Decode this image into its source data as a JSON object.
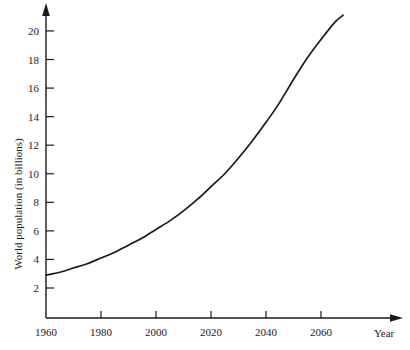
{
  "chart_data": {
    "type": "line",
    "title": "",
    "xlabel": "Year",
    "ylabel": "World population (in billions)",
    "xlim": [
      1955,
      2072
    ],
    "ylim": [
      0,
      21.6
    ],
    "grid": false,
    "legend": "none",
    "x_ticks": [
      1960,
      1980,
      2000,
      2020,
      2040,
      2060
    ],
    "x_tick_labels": [
      "1960",
      "1980",
      "2000",
      "2020",
      "2040",
      "2060"
    ],
    "y_ticks": [
      2,
      4,
      6,
      8,
      10,
      12,
      14,
      16,
      18,
      20
    ],
    "y_tick_labels": [
      "2",
      "4",
      "6",
      "8",
      "10",
      "12",
      "14",
      "16",
      "18",
      "20"
    ],
    "series": [
      {
        "name": "World population",
        "x": [
          1960,
          1965,
          1970,
          1975,
          1980,
          1985,
          1990,
          1995,
          2000,
          2005,
          2010,
          2015,
          2020,
          2025,
          2030,
          2035,
          2040,
          2045,
          2050,
          2055,
          2060,
          2065,
          2068
        ],
        "values": [
          2.9,
          3.1,
          3.4,
          3.7,
          4.1,
          4.5,
          5.0,
          5.5,
          6.1,
          6.7,
          7.4,
          8.2,
          9.1,
          10.0,
          11.1,
          12.3,
          13.6,
          15.0,
          16.6,
          18.1,
          19.4,
          20.6,
          21.1
        ]
      }
    ],
    "annotations": []
  },
  "axes": {
    "y_arrow": "up-arrow",
    "x_arrow": "right-arrow",
    "axis_color": "#1a1a1a"
  },
  "colors": {
    "background": "#ffffff",
    "axis": "#1a1a1a",
    "curve": "#1a1a1a",
    "text": "#1a1a1a"
  }
}
